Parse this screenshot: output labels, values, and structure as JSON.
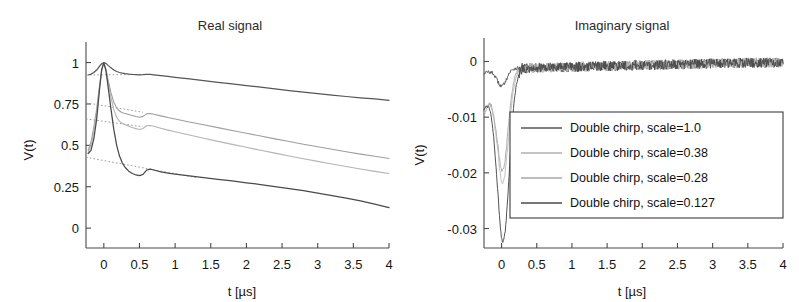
{
  "figure": {
    "axis_label_y": "V(t)",
    "axis_label_x": "t [µs]"
  },
  "series_colors": [
    "#565656",
    "#9e9e9e",
    "#b4b4b4",
    "#4a4a4a"
  ],
  "legend": {
    "items": [
      {
        "label": "Double chirp, scale=1.0",
        "color": "#565656"
      },
      {
        "label": "Double chirp, scale=0.38",
        "color": "#b0b0b0"
      },
      {
        "label": "Double chirp, scale=0.28",
        "color": "#a8a8a8"
      },
      {
        "label": "Double chirp, scale=0.127",
        "color": "#4a4a4a"
      }
    ]
  },
  "chart_data": [
    {
      "type": "line",
      "panel": "real",
      "title": "Real signal",
      "xlabel": "t [µs]",
      "ylabel": "V(t)",
      "xlim": [
        -0.25,
        4.0
      ],
      "ylim": [
        -0.12,
        1.1
      ],
      "xticks": [
        0,
        0.5,
        1,
        1.5,
        2,
        2.5,
        3,
        3.5,
        4
      ],
      "xtick_labels": [
        "0",
        "0.5",
        "1",
        "1.5",
        "2",
        "2.5",
        "3",
        "3.5",
        "4"
      ],
      "yticks": [
        0,
        0.25,
        0.5,
        0.75,
        1
      ],
      "ytick_labels": [
        "0",
        "0.25",
        "0.5",
        "0.75",
        "1"
      ],
      "grid": false,
      "legend_position": "none",
      "x": [
        -0.22,
        -0.18,
        -0.14,
        -0.1,
        -0.06,
        -0.03,
        0.0,
        0.03,
        0.06,
        0.1,
        0.14,
        0.18,
        0.22,
        0.26,
        0.3,
        0.35,
        0.4,
        0.45,
        0.5,
        0.55,
        0.6,
        0.65,
        0.7,
        0.8,
        0.9,
        1.0,
        1.2,
        1.4,
        1.6,
        1.8,
        2.0,
        2.2,
        2.4,
        2.6,
        2.8,
        3.0,
        3.2,
        3.4,
        3.6,
        3.8,
        4.0
      ],
      "series": [
        {
          "name": "Double chirp, scale=1.0",
          "color": "#565656",
          "values": [
            0.925,
            0.93,
            0.94,
            0.955,
            0.978,
            0.993,
            1.0,
            0.995,
            0.983,
            0.968,
            0.955,
            0.946,
            0.94,
            0.936,
            0.933,
            0.93,
            0.928,
            0.927,
            0.926,
            0.927,
            0.929,
            0.928,
            0.926,
            0.921,
            0.916,
            0.911,
            0.901,
            0.891,
            0.881,
            0.871,
            0.861,
            0.851,
            0.841,
            0.831,
            0.821,
            0.812,
            0.803,
            0.795,
            0.787,
            0.78,
            0.772
          ]
        },
        {
          "name": "Double chirp, scale=0.38",
          "color": "#9e9e9e",
          "values": [
            0.47,
            0.52,
            0.61,
            0.72,
            0.86,
            0.955,
            1.0,
            0.96,
            0.895,
            0.818,
            0.76,
            0.726,
            0.707,
            0.697,
            0.692,
            0.686,
            0.68,
            0.674,
            0.67,
            0.675,
            0.69,
            0.692,
            0.688,
            0.678,
            0.668,
            0.659,
            0.641,
            0.624,
            0.607,
            0.59,
            0.573,
            0.556,
            0.539,
            0.523,
            0.507,
            0.491,
            0.476,
            0.461,
            0.447,
            0.434,
            0.421
          ]
        },
        {
          "name": "Double chirp, scale=0.28",
          "color": "#b4b4b4",
          "values": [
            0.455,
            0.5,
            0.585,
            0.695,
            0.845,
            0.95,
            1.0,
            0.955,
            0.88,
            0.79,
            0.716,
            0.67,
            0.645,
            0.632,
            0.624,
            0.616,
            0.608,
            0.601,
            0.596,
            0.602,
            0.618,
            0.62,
            0.615,
            0.603,
            0.592,
            0.582,
            0.562,
            0.543,
            0.524,
            0.506,
            0.488,
            0.47,
            0.453,
            0.436,
            0.419,
            0.403,
            0.387,
            0.372,
            0.357,
            0.343,
            0.33
          ]
        },
        {
          "name": "Double chirp, scale=0.127",
          "color": "#4a4a4a",
          "values": [
            0.45,
            0.47,
            0.54,
            0.66,
            0.84,
            0.958,
            1.0,
            0.95,
            0.855,
            0.72,
            0.596,
            0.5,
            0.435,
            0.393,
            0.366,
            0.344,
            0.33,
            0.321,
            0.317,
            0.325,
            0.35,
            0.356,
            0.351,
            0.34,
            0.332,
            0.326,
            0.315,
            0.305,
            0.295,
            0.285,
            0.274,
            0.263,
            0.251,
            0.239,
            0.226,
            0.212,
            0.197,
            0.181,
            0.164,
            0.145,
            0.124
          ]
        }
      ],
      "dotted_guides": [
        {
          "name": "guide-upper",
          "from": [
            -0.25,
            0.925
          ],
          "to": [
            0.6,
            0.928
          ]
        },
        {
          "name": "guide-mid-upper",
          "from": [
            -0.25,
            0.757
          ],
          "to": [
            0.55,
            0.7
          ]
        },
        {
          "name": "guide-mid-lower",
          "from": [
            -0.25,
            0.66
          ],
          "to": [
            0.55,
            0.612
          ]
        },
        {
          "name": "guide-lower",
          "from": [
            -0.25,
            0.428
          ],
          "to": [
            1.3,
            0.305
          ]
        }
      ]
    },
    {
      "type": "line",
      "panel": "imaginary",
      "title": "Imaginary signal",
      "xlabel": "t [µs]",
      "ylabel": "V(t)",
      "xlim": [
        -0.25,
        4.0
      ],
      "ylim": [
        -0.0335,
        0.0035
      ],
      "xticks": [
        0,
        0.5,
        1,
        1.5,
        2,
        2.5,
        3,
        3.5,
        4
      ],
      "xtick_labels": [
        "0",
        "0.5",
        "1",
        "1.5",
        "2",
        "2.5",
        "3",
        "3.5",
        "4"
      ],
      "yticks": [
        0,
        -0.01,
        -0.02,
        -0.03
      ],
      "ytick_labels": [
        "0",
        "-0.01",
        "-0.02",
        "-0.03"
      ],
      "grid": false,
      "legend_position": "center-right",
      "noise_amplitude": 0.0009,
      "baseline": -0.0012,
      "series": [
        {
          "name": "Double chirp, scale=1.0",
          "color": "#565656",
          "dip_depth": -0.0032,
          "dip_center": 0.0,
          "dip_width": 0.09,
          "start_value": -0.0022
        },
        {
          "name": "Double chirp, scale=0.38",
          "color": "#9e9e9e",
          "dip_depth": -0.0185,
          "dip_center": 0.01,
          "dip_width": 0.105,
          "start_value": -0.0105
        },
        {
          "name": "Double chirp, scale=0.28",
          "color": "#b4b4b4",
          "dip_depth": -0.0205,
          "dip_center": 0.015,
          "dip_width": 0.11,
          "start_value": -0.0098
        },
        {
          "name": "Double chirp, scale=0.127",
          "color": "#4a4a4a",
          "dip_depth": -0.0312,
          "dip_center": 0.02,
          "dip_width": 0.115,
          "start_value": -0.0092
        }
      ]
    }
  ]
}
